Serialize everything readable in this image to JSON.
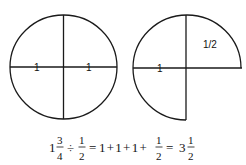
{
  "diagram": {
    "left_circle": {
      "shape": "whole circle split into quarters",
      "labels": [
        "1",
        "1"
      ]
    },
    "right_circle": {
      "shape": "three-quarter circle",
      "labels": [
        "1",
        "1/2"
      ]
    },
    "equation": {
      "whole": "1",
      "num1": "3",
      "den1": "4",
      "div": "÷",
      "num2": "1",
      "den2": "2",
      "eq1": "=",
      "terms": "1 + 1 + 1 +",
      "num3": "1",
      "den3": "2",
      "eq2": "=",
      "result_whole": "3",
      "num4": "1",
      "den4": "2"
    },
    "colors": {
      "stroke": "#1a1a1a",
      "background": "#ffffff"
    }
  }
}
